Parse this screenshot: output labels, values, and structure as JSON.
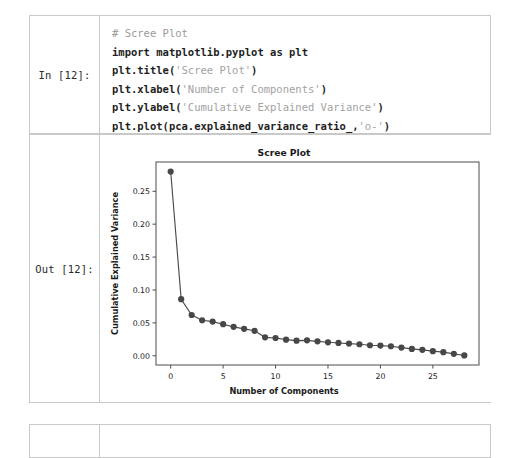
{
  "notebook": {
    "cells": [
      {
        "prompt": "In [12]:",
        "type": "code",
        "source_lines": [
          "# Scree Plot",
          "import matplotlib.pyplot as plt",
          "plt.title('Scree Plot')",
          "plt.xlabel('Number of Components')",
          "plt.ylabel('Cumulative Explained Variance')",
          "plt.plot(pca.explained_variance_ratio_,'o-')"
        ]
      },
      {
        "prompt": "Out [12]:",
        "type": "figure"
      },
      {
        "prompt": "",
        "type": "empty"
      }
    ]
  },
  "code": {
    "line1_comment": "# Scree Plot",
    "line2_kw": "import",
    "line2_mod": "matplotlib.pyplot",
    "line2_as": "as",
    "line2_alias": "plt",
    "line3_call": "plt.title(",
    "line3_str": "'Scree Plot'",
    "line3_close": ")",
    "line4_call": "plt.xlabel(",
    "line4_str": "'Number of Components'",
    "line4_close": ")",
    "line5_call": "plt.ylabel(",
    "line5_str": "'Cumulative Explained Variance'",
    "line5_close": ")",
    "line6_call": "plt.plot(pca.explained_variance_ratio_,",
    "line6_str": "'o-'",
    "line6_close": ")"
  },
  "chart_data": {
    "type": "line",
    "title": "Scree Plot",
    "xlabel": "Number of Components",
    "ylabel": "Cumulative Explained Variance",
    "marker": "o",
    "linestyle": "-",
    "color": "#474747",
    "grid": false,
    "legend": null,
    "xlim": [
      -1.4,
      29.4
    ],
    "ylim": [
      -0.014,
      0.2945
    ],
    "xticks": [
      0,
      5,
      10,
      15,
      20,
      25
    ],
    "xticklabels": [
      "0",
      "5",
      "10",
      "15",
      "20",
      "25"
    ],
    "yticks": [
      0.0,
      0.05,
      0.1,
      0.15,
      0.2,
      0.25
    ],
    "yticklabels": [
      "0.00",
      "0.05",
      "0.10",
      "0.15",
      "0.20",
      "0.25"
    ],
    "x": [
      0,
      1,
      2,
      3,
      4,
      5,
      6,
      7,
      8,
      9,
      10,
      11,
      12,
      13,
      14,
      15,
      16,
      17,
      18,
      19,
      20,
      21,
      22,
      23,
      24,
      25,
      26,
      27,
      28
    ],
    "values": [
      0.28,
      0.086,
      0.062,
      0.054,
      0.052,
      0.048,
      0.044,
      0.041,
      0.038,
      0.028,
      0.027,
      0.0245,
      0.023,
      0.0235,
      0.022,
      0.0205,
      0.0195,
      0.0185,
      0.0175,
      0.016,
      0.0155,
      0.0145,
      0.0125,
      0.0105,
      0.009,
      0.007,
      0.0055,
      0.003,
      0.0005
    ]
  }
}
